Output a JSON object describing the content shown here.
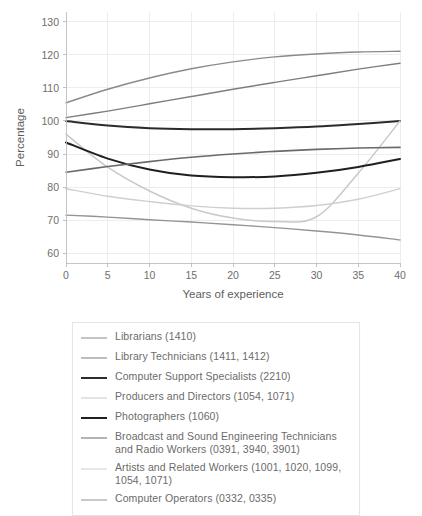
{
  "chart_data": {
    "type": "line",
    "title": "",
    "xlabel": "Years of experience",
    "ylabel": "Percentage",
    "xlim": [
      0,
      40
    ],
    "ylim": [
      57,
      133
    ],
    "grid": true,
    "legend_position": "below-plot",
    "xticks": [
      0,
      5,
      10,
      15,
      20,
      25,
      30,
      35,
      40
    ],
    "yticks": [
      60,
      70,
      80,
      90,
      100,
      110,
      120,
      130
    ],
    "x": [
      0,
      5,
      10,
      15,
      20,
      25,
      30,
      35,
      40
    ],
    "series": [
      {
        "name": "Librarians (1410)",
        "code": "1410",
        "color": "#8a8a8a",
        "width": 1.4,
        "values": [
          105.5,
          109.6,
          113.0,
          115.8,
          117.9,
          119.4,
          120.3,
          120.9,
          121.1
        ]
      },
      {
        "name": "Library Technicians (1411, 1412)",
        "code": "1411, 1412",
        "color": "#7d7d7d",
        "width": 1.4,
        "values": [
          101.0,
          103.0,
          105.2,
          107.4,
          109.6,
          111.7,
          113.7,
          115.7,
          117.5
        ]
      },
      {
        "name": "Computer Support Specialists (2210)",
        "code": "2210",
        "color": "#2b2b2b",
        "width": 2.0,
        "values": [
          100.0,
          98.6,
          97.8,
          97.5,
          97.5,
          97.8,
          98.3,
          99.1,
          100.0
        ]
      },
      {
        "name": "Producers and Directors (1054, 1071)",
        "code": "1054, 1071",
        "color": "#c9c9c9",
        "width": 1.5,
        "values": [
          96.0,
          86.0,
          78.8,
          73.6,
          70.6,
          69.6,
          71.0,
          84.2,
          100.0
        ]
      },
      {
        "name": "Photographers (1060)",
        "code": "1060",
        "color": "#1f1f1f",
        "width": 2.0,
        "values": [
          93.5,
          88.6,
          85.3,
          83.5,
          83.0,
          83.2,
          84.3,
          86.1,
          88.5
        ]
      },
      {
        "name": "Broadcast and Sound Engineering Technicians and Radio Workers (0391, 3940, 3901)",
        "code": "0391, 3940, 3901",
        "color": "#6a6a6a",
        "width": 1.6,
        "values": [
          84.5,
          86.2,
          87.7,
          89.0,
          90.0,
          90.8,
          91.4,
          91.8,
          92.0
        ]
      },
      {
        "name": "Artists and Related Workers (1001, 1020, 1099, 1054, 1071)",
        "code": "1001, 1020, 1099, 1054, 1071",
        "color": "#cfcfcf",
        "width": 1.4,
        "values": [
          79.5,
          77.2,
          75.6,
          74.3,
          73.6,
          73.6,
          74.4,
          76.3,
          79.5
        ]
      },
      {
        "name": "Computer Operators (0332, 0335)",
        "code": "0332, 0335",
        "color": "#949494",
        "width": 1.4,
        "values": [
          71.5,
          70.9,
          70.1,
          69.4,
          68.6,
          67.7,
          66.7,
          65.5,
          64.0
        ]
      }
    ]
  },
  "axes": {
    "y_title": "Percentage",
    "x_title": "Years of experience",
    "y_tick_labels": [
      "60",
      "70",
      "80",
      "90",
      "100",
      "110",
      "120",
      "130"
    ],
    "x_tick_labels": [
      "0",
      "5",
      "10",
      "15",
      "20",
      "25",
      "30",
      "35",
      "40"
    ]
  },
  "legend": {
    "items": [
      {
        "label": "Librarians (1410)"
      },
      {
        "label": "Library Technicians (1411, 1412)"
      },
      {
        "label": "Computer Support Specialists (2210)"
      },
      {
        "label": "Producers and Directors (1054, 1071)"
      },
      {
        "label": "Photographers (1060)"
      },
      {
        "label": "Broadcast and Sound Engineering Technicians and Radio Workers (0391, 3940, 3901)"
      },
      {
        "label": "Artists and Related Workers (1001, 1020, 1099, 1054, 1071)"
      },
      {
        "label": "Computer Operators (0332, 0335)"
      }
    ]
  },
  "colors": {
    "grid": "#e9e9e9",
    "axis": "#bfbfbf",
    "text": "#6b6b6b",
    "legend_border": "#e4e4e4",
    "background": "#ffffff"
  }
}
